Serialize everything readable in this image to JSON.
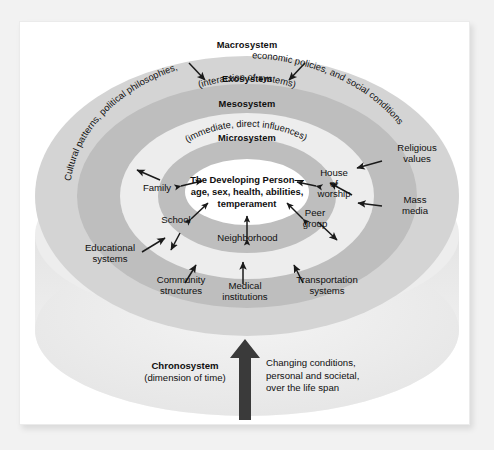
{
  "figure": {
    "type": "concentric-ellipse-diagram"
  },
  "colors": {
    "background": "#f2f2f2",
    "page": "#ffffff",
    "ring_macro": "#d2d2d2",
    "ring_exo": "#bdbdbd",
    "ring_meso": "#ededed",
    "ring_micro": "#bdbdbd",
    "ring_center": "#ffffff",
    "cylinder_base": "#ececec",
    "arrow": "#1a1a1a",
    "text": "#111111"
  },
  "rings": [
    {
      "id": "macrosystem",
      "title": "Macrosystem",
      "subtitle": "",
      "curved_label": "Cultural patterns, political philosophies, economic policies, and social conditions"
    },
    {
      "id": "exosystem",
      "title": "Exosystem",
      "subtitle": ""
    },
    {
      "id": "mesosystem",
      "title": "Mesosystem",
      "subtitle": "(interaction of systems)"
    },
    {
      "id": "microsystem",
      "title": "Microsystem",
      "subtitle": "(immediate, direct influences)"
    }
  ],
  "center": {
    "line1": "The Developing Person—",
    "line2": "age, sex, health, abilities,",
    "line3": "temperament"
  },
  "microsystem_nodes": [
    {
      "id": "family",
      "label": "Family"
    },
    {
      "id": "school",
      "label": "School"
    },
    {
      "id": "neighborhood",
      "label": "Neighborhood"
    },
    {
      "id": "peer-group",
      "label": "Peer\ngroup"
    },
    {
      "id": "house-of-worship",
      "label": "House\nof\nworship"
    }
  ],
  "exosystem_nodes": [
    {
      "id": "educational-systems",
      "label": "Educational\nsystems"
    },
    {
      "id": "community-structures",
      "label": "Community\nstructures"
    },
    {
      "id": "medical-institutions",
      "label": "Medical\ninstitutions"
    },
    {
      "id": "transportation-systems",
      "label": "Transportation\nsystems"
    },
    {
      "id": "mass-media",
      "label": "Mass\nmedia"
    },
    {
      "id": "religious-values",
      "label": "Religious\nvalues"
    }
  ],
  "chronosystem": {
    "title": "Chronosystem",
    "subtitle": "(dimension of time)",
    "description": "Changing conditions,\npersonal and societal,\nover the life span",
    "arrow_direction": "up"
  }
}
